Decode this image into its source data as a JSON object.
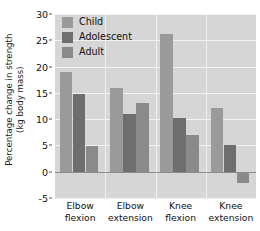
{
  "chart_data": {
    "type": "bar",
    "title": "",
    "xlabel": "",
    "ylabel": "Percentage change in strength (kg body mass)",
    "ylabel_line1": "Percentage change in strength",
    "ylabel_line2": "(kg body mass)",
    "categories": [
      "Elbow flexion",
      "Elbow extension",
      "Knee flexion",
      "Knee extension"
    ],
    "category_lines": [
      [
        "Elbow",
        "flexion"
      ],
      [
        "Elbow",
        "extension"
      ],
      [
        "Knee",
        "flexion"
      ],
      [
        "Knee",
        "extension"
      ]
    ],
    "series": [
      {
        "name": "Child",
        "color": "#9a9a9a",
        "values": [
          19.0,
          16.0,
          26.2,
          12.2
        ]
      },
      {
        "name": "Adolescent",
        "color": "#6e6e6e",
        "values": [
          14.7,
          11.0,
          10.2,
          5.0
        ]
      },
      {
        "name": "Adult",
        "color": "#8a8a8a",
        "values": [
          4.8,
          13.0,
          7.0,
          -2.2
        ]
      }
    ],
    "ylim": [
      -5,
      30
    ],
    "yticks": [
      30,
      25,
      20,
      15,
      10,
      5,
      0,
      -5
    ],
    "ytick_labels": [
      "30",
      "25",
      "20",
      "15",
      "10",
      "5",
      "0",
      "-5"
    ],
    "grid": "horizontal-and-group-separators",
    "legend_position": "top-left-inside",
    "plot_background": "#d6d6d6",
    "gridline_color": "#f2f2f2",
    "zeroline_color": "#8c8c8c",
    "axis_color": "#5a5a5a"
  }
}
